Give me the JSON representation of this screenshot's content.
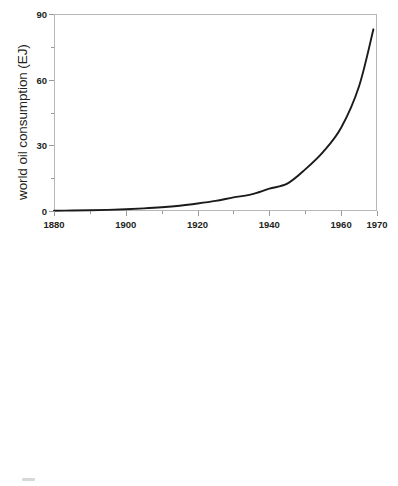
{
  "figure": {
    "background": "#ffffff",
    "frame_color": "#b7b7b7",
    "data_line_color": "#1a1a1a",
    "reference_line_color": "#8c8c8c"
  },
  "chart_data": [
    {
      "id": "linear-panel",
      "type": "line",
      "title": "",
      "xlabel": "",
      "ylabel": "world oil consumption (EJ)",
      "xlim": [
        1880,
        1970
      ],
      "ylim": [
        0,
        90
      ],
      "yscale": "linear",
      "xscale": "linear",
      "grid": false,
      "legend": "none",
      "ytick_labels": [
        "0",
        "30",
        "60",
        "90"
      ],
      "ytick_values": [
        0,
        30,
        60,
        90
      ],
      "yminor_values": [
        15,
        45,
        75
      ],
      "xtick_labels": [
        "1880",
        "1900",
        "1920",
        "1940",
        "1960",
        "1970"
      ],
      "xtick_values": [
        1880,
        1900,
        1920,
        1940,
        1960,
        1970
      ],
      "xminor_values": [
        1890,
        1910,
        1930,
        1950
      ],
      "series": [
        {
          "name": "world oil consumption",
          "style": "solid-thick-black",
          "x": [
            1880,
            1885,
            1890,
            1895,
            1900,
            1905,
            1910,
            1915,
            1920,
            1925,
            1930,
            1935,
            1940,
            1945,
            1950,
            1955,
            1960,
            1965,
            1969
          ],
          "values": [
            0.12,
            0.2,
            0.32,
            0.52,
            0.82,
            1.2,
            1.7,
            2.4,
            3.4,
            4.6,
            6.2,
            7.6,
            10.2,
            12.5,
            19.0,
            27.0,
            38.0,
            57.0,
            83.0
          ]
        }
      ]
    },
    {
      "id": "log-panel",
      "type": "line",
      "title": "",
      "xlabel": "",
      "ylabel": "world oil consumption (EJ)",
      "xlim": [
        1880,
        1970
      ],
      "ylim": [
        0.1,
        100
      ],
      "yscale": "log",
      "xscale": "linear",
      "grid": false,
      "legend": "none",
      "ytick_labels": [
        "0.1",
        "1",
        "10",
        "100"
      ],
      "ytick_values": [
        0.1,
        1,
        10,
        100
      ],
      "yminor_values": [
        0.3,
        3,
        30
      ],
      "xtick_labels": [
        "1880",
        "1890",
        "1900",
        "1910",
        "1920",
        "1930",
        "1940",
        "1950",
        "1960",
        "1970"
      ],
      "xtick_values": [
        1880,
        1890,
        1900,
        1910,
        1920,
        1930,
        1940,
        1950,
        1960,
        1970
      ],
      "series": [
        {
          "name": "world oil consumption",
          "style": "solid-thick-black",
          "x": [
            1880,
            1885,
            1890,
            1895,
            1898,
            1900,
            1905,
            1910,
            1915,
            1920,
            1925,
            1930,
            1935,
            1940,
            1945,
            1950,
            1955,
            1960,
            1965,
            1969
          ],
          "values": [
            0.12,
            0.2,
            0.32,
            0.52,
            0.7,
            0.82,
            1.2,
            1.7,
            2.4,
            3.4,
            4.6,
            6.2,
            7.6,
            10.2,
            12.5,
            19.0,
            27.0,
            38.0,
            57.0,
            83.0
          ]
        },
        {
          "name": "exponential reference line",
          "style": "solid-thin-gray",
          "x": [
            1880,
            1970
          ],
          "values": [
            0.145,
            100.0
          ]
        }
      ]
    }
  ]
}
